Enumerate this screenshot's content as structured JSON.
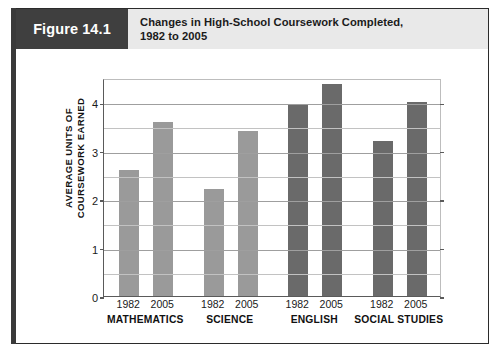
{
  "figure": {
    "tab_label": "Figure 14.1",
    "title_line1": "Changes in High-School Coursework Completed,",
    "title_line2": "1982 to 2005"
  },
  "colors": {
    "tab_background": "#3f3f3f",
    "header_background": "#e9e9e9",
    "frame_border": "#2b2b2b",
    "bar_light": "#9a9a9a",
    "bar_dark": "#6a6a6a",
    "gridline": "#c2c2c2",
    "axis": "#5a5a5a"
  },
  "chart_data": {
    "type": "bar",
    "title": "Changes in High-School Coursework Completed, 1982 to 2005",
    "xlabel": "",
    "ylabel": "AVERAGE UNITS OF COURSEWORK EARNED",
    "ylabel_line1": "AVERAGE UNITS OF",
    "ylabel_line2": "COURSEWORK EARNED",
    "ylim": [
      0,
      4.5
    ],
    "ytick_labels": [
      "0",
      "1",
      "2",
      "3",
      "4"
    ],
    "ytick_values": [
      0,
      1,
      2,
      3,
      4
    ],
    "gridline_values": [
      0.5,
      1,
      1.5,
      2,
      2.5,
      3,
      3.5,
      4
    ],
    "grid": true,
    "legend": "none",
    "categories": [
      "MATHEMATICS",
      "SCIENCE",
      "ENGLISH",
      "SOCIAL STUDIES"
    ],
    "series": [
      {
        "name": "1982",
        "values": [
          2.6,
          2.2,
          3.95,
          3.2
        ]
      },
      {
        "name": "2005",
        "values": [
          3.6,
          3.4,
          4.37,
          4.0
        ]
      }
    ],
    "bars": [
      {
        "category": "MATHEMATICS",
        "year": "1982",
        "value": 2.6,
        "color": "#9a9a9a"
      },
      {
        "category": "MATHEMATICS",
        "year": "2005",
        "value": 3.6,
        "color": "#9a9a9a"
      },
      {
        "category": "SCIENCE",
        "year": "1982",
        "value": 2.2,
        "color": "#9a9a9a"
      },
      {
        "category": "SCIENCE",
        "year": "2005",
        "value": 3.4,
        "color": "#9a9a9a"
      },
      {
        "category": "ENGLISH",
        "year": "1982",
        "value": 3.95,
        "color": "#6a6a6a"
      },
      {
        "category": "ENGLISH",
        "year": "2005",
        "value": 4.37,
        "color": "#6a6a6a"
      },
      {
        "category": "SOCIAL STUDIES",
        "year": "1982",
        "value": 3.2,
        "color": "#6a6a6a"
      },
      {
        "category": "SOCIAL STUDIES",
        "year": "2005",
        "value": 4.0,
        "color": "#6a6a6a"
      }
    ]
  }
}
